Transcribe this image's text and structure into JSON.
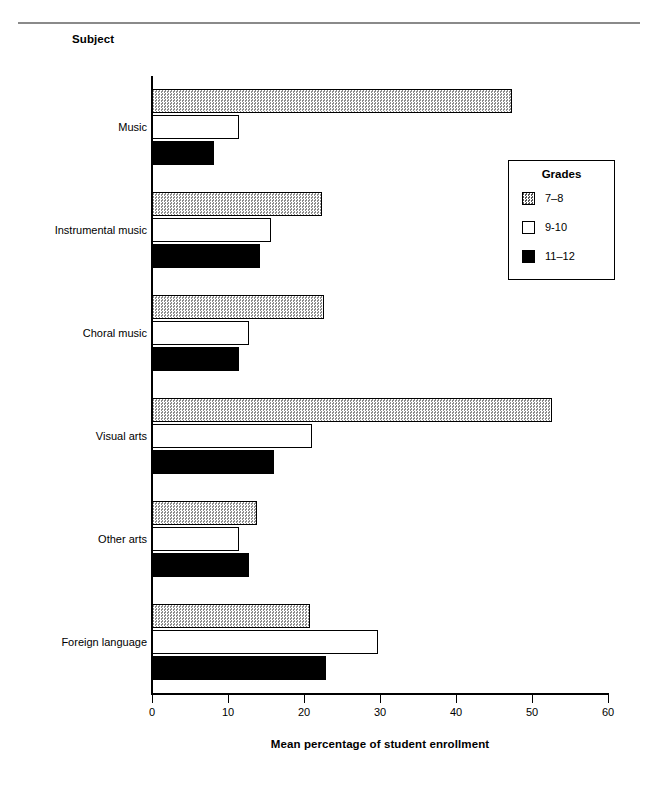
{
  "page": {
    "subject_axis_title": "Subject",
    "x_axis_title": "Mean percentage of student enrollment"
  },
  "legend": {
    "title": "Grades",
    "position": "inside-right-upper",
    "entries": [
      {
        "label": "7–8",
        "pattern": "checkered-gray",
        "color": "#c9c9c9"
      },
      {
        "label": "9-10",
        "pattern": "open-white",
        "color": "#ffffff"
      },
      {
        "label": "11–12",
        "pattern": "solid-black",
        "color": "#000000"
      }
    ]
  },
  "chart_data": {
    "type": "bar",
    "orientation": "horizontal",
    "title": "",
    "subtitle": "",
    "xlabel": "Mean percentage of student enrollment",
    "ylabel": "Subject",
    "xlim": [
      0,
      60
    ],
    "xticks": [
      0,
      10,
      20,
      30,
      40,
      50,
      60
    ],
    "xticklabels": [
      "0",
      "10",
      "20",
      "30",
      "40",
      "50",
      "60"
    ],
    "grid": false,
    "legend_position": "inside-right-upper",
    "categories": [
      "Music",
      "Instrumental music",
      "Choral music",
      "Visual arts",
      "Other arts",
      "Foreign language"
    ],
    "series": [
      {
        "name": "7–8",
        "values": [
          47.4,
          22.4,
          22.6,
          52.6,
          13.8,
          20.8
        ]
      },
      {
        "name": "9-10",
        "values": [
          11.5,
          15.7,
          12.7,
          21.0,
          11.5,
          29.7
        ]
      },
      {
        "name": "11–12",
        "values": [
          8.2,
          14.2,
          11.5,
          16.0,
          12.7,
          22.9
        ]
      }
    ]
  }
}
